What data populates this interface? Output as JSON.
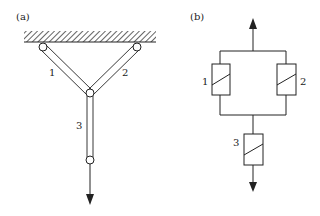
{
  "panel_a": {
    "label": "(a)",
    "description": "Three-bar structure hanging from a fixed ceiling with a downward load",
    "members": [
      {
        "id": "bar-1",
        "label": "1"
      },
      {
        "id": "bar-2",
        "label": "2"
      },
      {
        "id": "bar-3",
        "label": "3"
      }
    ],
    "load_direction": "down"
  },
  "panel_b": {
    "label": "(b)",
    "description": "Equivalent model: elements 1 and 2 in parallel, in series with element 3",
    "elements": [
      {
        "id": "element-1",
        "label": "1"
      },
      {
        "id": "element-2",
        "label": "2"
      },
      {
        "id": "element-3",
        "label": "3"
      }
    ],
    "arrows": [
      "up",
      "down"
    ]
  },
  "colors": {
    "stroke": "#222222",
    "background": "#ffffff"
  }
}
